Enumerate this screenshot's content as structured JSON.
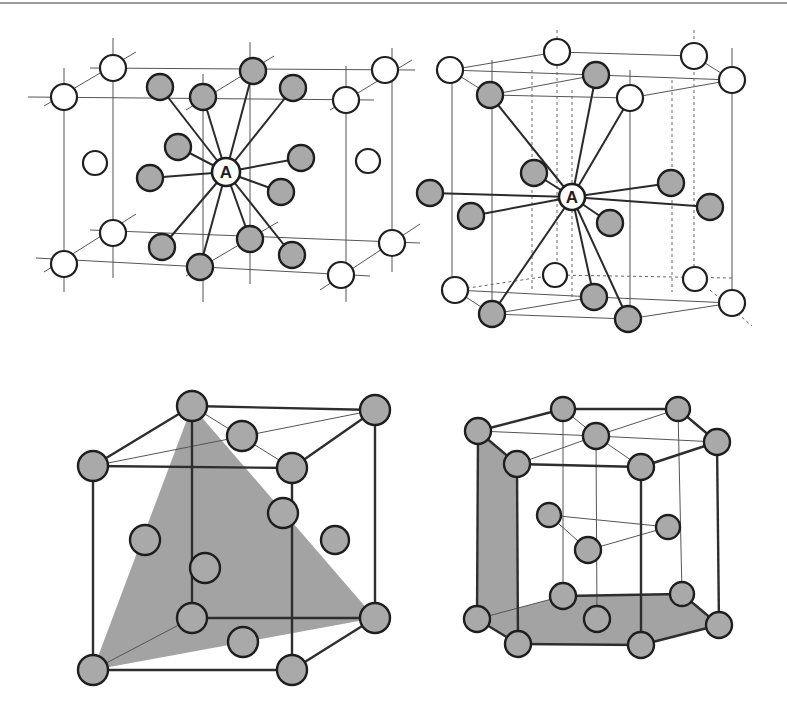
{
  "figure": {
    "panels": [
      {
        "id": "fcc-coordination",
        "center_label": "A",
        "center": [
          226,
          172
        ],
        "white_atoms": [
          [
            64,
            97
          ],
          [
            113,
            68
          ],
          [
            95,
            163
          ],
          [
            385,
            70
          ],
          [
            346,
            100
          ],
          [
            368,
            161
          ],
          [
            64,
            264
          ],
          [
            113,
            233
          ],
          [
            392,
            243
          ],
          [
            341,
            275
          ]
        ],
        "gray_atoms": [
          [
            160,
            87
          ],
          [
            203,
            97
          ],
          [
            253,
            71
          ],
          [
            293,
            88
          ],
          [
            178,
            147
          ],
          [
            150,
            178
          ],
          [
            301,
            158
          ],
          [
            281,
            192
          ],
          [
            162,
            247
          ],
          [
            200,
            267
          ],
          [
            250,
            239
          ],
          [
            292,
            255
          ]
        ]
      },
      {
        "id": "hcp-coordination",
        "center_label": "A",
        "center": [
          572,
          197
        ],
        "white_atoms": [
          [
            450,
            70
          ],
          [
            557,
            52
          ],
          [
            694,
            56
          ],
          [
            732,
            80
          ],
          [
            630,
            98
          ],
          [
            555,
            275
          ],
          [
            695,
            279
          ],
          [
            455,
            290
          ],
          [
            732,
            303
          ]
        ],
        "gray_atoms": [
          [
            490,
            95
          ],
          [
            596,
            75
          ],
          [
            534,
            173
          ],
          [
            430,
            193
          ],
          [
            471,
            216
          ],
          [
            671,
            183
          ],
          [
            710,
            207
          ],
          [
            610,
            223
          ],
          [
            594,
            297
          ],
          [
            492,
            314
          ],
          [
            628,
            319
          ]
        ]
      },
      {
        "id": "fcc-unit-cell",
        "atoms": [
          [
            192,
            406
          ],
          [
            375,
            410
          ],
          [
            93,
            466
          ],
          [
            292,
            468
          ],
          [
            242,
            436
          ],
          [
            283,
            513
          ],
          [
            145,
            540
          ],
          [
            335,
            540
          ],
          [
            205,
            568
          ],
          [
            192,
            618
          ],
          [
            375,
            618
          ],
          [
            243,
            642
          ],
          [
            93,
            670
          ],
          [
            292,
            670
          ]
        ],
        "plane": [
          [
            93,
            670
          ],
          [
            192,
            406
          ],
          [
            375,
            618
          ]
        ]
      },
      {
        "id": "hcp-unit-cell",
        "atoms": [
          [
            563,
            409
          ],
          [
            678,
            409
          ],
          [
            478,
            431
          ],
          [
            596,
            436
          ],
          [
            717,
            442
          ],
          [
            517,
            464
          ],
          [
            641,
            467
          ],
          [
            549,
            515
          ],
          [
            668,
            527
          ],
          [
            588,
            550
          ],
          [
            563,
            596
          ],
          [
            682,
            594
          ],
          [
            477,
            619
          ],
          [
            597,
            619
          ],
          [
            719,
            625
          ],
          [
            518,
            644
          ],
          [
            641,
            645
          ]
        ],
        "planes": [
          [
            [
              478,
              431
            ],
            [
              517,
              464
            ],
            [
              518,
              644
            ],
            [
              477,
              619
            ]
          ],
          [
            [
              477,
              619
            ],
            [
              563,
              596
            ],
            [
              682,
              594
            ],
            [
              719,
              625
            ],
            [
              641,
              645
            ],
            [
              518,
              644
            ]
          ]
        ]
      }
    ]
  }
}
